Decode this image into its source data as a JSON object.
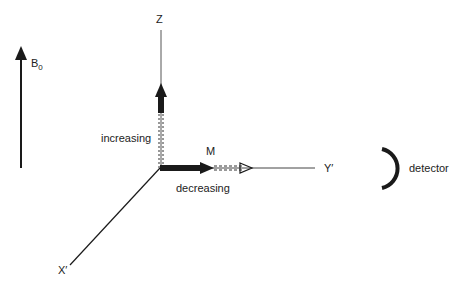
{
  "diagram": {
    "type": "magnetization-vector-rotating-frame",
    "colors": {
      "ink": "#1a1a1a",
      "axis": "#444444",
      "background": "#ffffff"
    },
    "field": {
      "label": "B",
      "subscript": "0"
    },
    "axes": {
      "z": "Z",
      "y": "Y′",
      "x": "X′"
    },
    "vectors": {
      "magnetization": "M",
      "z_component_note": "increasing",
      "y_component_note": "decreasing"
    },
    "detector": {
      "label": "detector"
    }
  }
}
